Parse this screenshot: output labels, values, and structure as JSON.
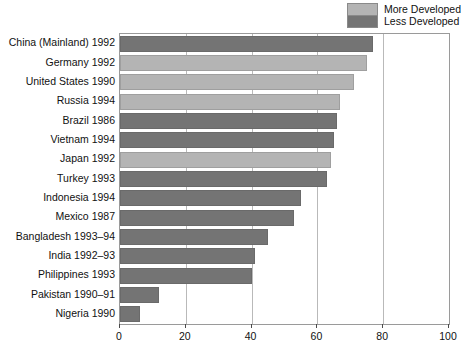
{
  "chart_data": {
    "type": "bar",
    "orientation": "horizontal",
    "title": "",
    "subtitle": "",
    "xlabel": "",
    "ylabel": "",
    "xlim": [
      0,
      100
    ],
    "ylim": null,
    "grid": true,
    "xticks": [
      0,
      20,
      40,
      60,
      80,
      100
    ],
    "xticklabels": [
      "0",
      "20",
      "40",
      "60",
      "80",
      "100"
    ],
    "legend_position": "top-right",
    "legend": [
      {
        "name": "More Developed",
        "color": "#b4b4b4"
      },
      {
        "name": "Less Developed",
        "color": "#747474"
      }
    ],
    "categories": [
      "China (Mainland) 1992",
      "Germany 1992",
      "United States 1990",
      "Russia 1994",
      "Brazil 1986",
      "Vietnam 1994",
      "Japan 1992",
      "Turkey 1993",
      "Indonesia 1994",
      "Mexico 1987",
      "Bangladesh 1993–94",
      "India 1992–93",
      "Philippines 1993",
      "Pakistan 1990–91",
      "Nigeria 1990"
    ],
    "values": [
      77,
      75,
      71,
      67,
      66,
      65,
      64,
      63,
      55,
      53,
      45,
      41,
      40,
      12,
      6
    ],
    "groups": [
      "Less Developed",
      "More Developed",
      "More Developed",
      "More Developed",
      "Less Developed",
      "Less Developed",
      "More Developed",
      "Less Developed",
      "Less Developed",
      "Less Developed",
      "Less Developed",
      "Less Developed",
      "Less Developed",
      "Less Developed",
      "Less Developed"
    ]
  }
}
